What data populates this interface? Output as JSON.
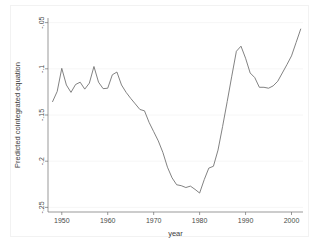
{
  "figure": {
    "background_color": "#ffffff",
    "frame_color": "#f2f2f2",
    "plot_area": {
      "left": 48,
      "top": 18,
      "right": 303,
      "bottom": 212
    }
  },
  "chart_data": {
    "type": "line",
    "title": "",
    "xlabel": "year",
    "ylabel": "Predicted cointegrated equation",
    "xlim": [
      1947.0,
      2002.5
    ],
    "ylim": [
      -0.255,
      -0.045
    ],
    "grid": true,
    "grid_axis": "y",
    "legend": false,
    "legend_position": "none",
    "line_color": "#6b6b6b",
    "xticks": [
      1950,
      1960,
      1970,
      1980,
      1990,
      2000
    ],
    "xticklabels": [
      "1950",
      "1960",
      "1970",
      "1980",
      "1990",
      "2000"
    ],
    "yticks": [
      -0.05,
      -0.1,
      -0.15,
      -0.2,
      -0.25
    ],
    "yticklabels": [
      "-.05",
      "-.1",
      "-.15",
      "-.2",
      "-.25"
    ],
    "series": [
      {
        "name": "Predicted cointegrated equation",
        "x": [
          1948,
          1949,
          1950,
          1951,
          1952,
          1953,
          1954,
          1955,
          1956,
          1957,
          1958,
          1959,
          1960,
          1961,
          1962,
          1963,
          1964,
          1965,
          1966,
          1967,
          1968,
          1969,
          1970,
          1971,
          1972,
          1973,
          1974,
          1975,
          1976,
          1977,
          1978,
          1979,
          1980,
          1981,
          1982,
          1983,
          1984,
          1985,
          1986,
          1987,
          1988,
          1989,
          1990,
          1991,
          1992,
          1993,
          1994,
          1995,
          1996,
          1997,
          1998,
          1999,
          2000,
          2001,
          2002
        ],
        "values": [
          -0.1355,
          -0.1245,
          -0.0995,
          -0.1175,
          -0.1255,
          -0.117,
          -0.1145,
          -0.122,
          -0.1155,
          -0.0975,
          -0.1145,
          -0.1215,
          -0.121,
          -0.1065,
          -0.1035,
          -0.1175,
          -0.1255,
          -0.132,
          -0.138,
          -0.144,
          -0.1455,
          -0.158,
          -0.168,
          -0.178,
          -0.1905,
          -0.2065,
          -0.218,
          -0.2255,
          -0.2265,
          -0.2285,
          -0.227,
          -0.2305,
          -0.2345,
          -0.22,
          -0.2075,
          -0.2055,
          -0.188,
          -0.1625,
          -0.1355,
          -0.108,
          -0.081,
          -0.0755,
          -0.0885,
          -0.1045,
          -0.1095,
          -0.12,
          -0.12,
          -0.121,
          -0.1185,
          -0.1135,
          -0.1045,
          -0.0955,
          -0.086,
          -0.0715,
          -0.057
        ]
      }
    ]
  }
}
